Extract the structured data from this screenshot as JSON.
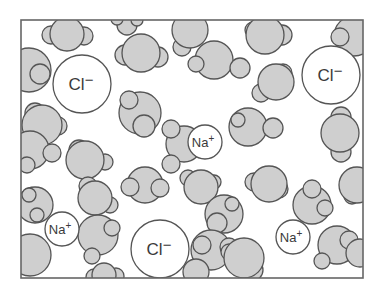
{
  "diagram": {
    "frame": {
      "x": 21,
      "y": 20,
      "w": 342,
      "h": 258
    },
    "colors": {
      "water_fill": "#cfcfcf",
      "stroke": "#555555",
      "ion_fill": "#ffffff",
      "background": "#ffffff"
    },
    "ions": [
      {
        "label": "Cl",
        "charge": "−",
        "cx": 82,
        "cy": 84,
        "r": 29
      },
      {
        "label": "Cl",
        "charge": "−",
        "cx": 331,
        "cy": 75,
        "r": 29
      },
      {
        "label": "Cl",
        "charge": "−",
        "cx": 160,
        "cy": 249,
        "r": 29
      },
      {
        "label": "Na",
        "charge": "+",
        "cx": 62,
        "cy": 229,
        "r": 17
      },
      {
        "label": "Na",
        "charge": "+",
        "cx": 205,
        "cy": 142,
        "r": 17
      },
      {
        "label": "Na",
        "charge": "+",
        "cx": 293,
        "cy": 237,
        "r": 17
      }
    ],
    "water_molecules": [
      {
        "o": [
          67,
          34,
          17
        ],
        "h": [
          [
            51,
            35,
            9
          ],
          [
            84,
            36,
            9
          ]
        ]
      },
      {
        "o": [
          127,
          25,
          10
        ],
        "h": [
          [
            117,
            19,
            6
          ],
          [
            137,
            20,
            6
          ]
        ]
      },
      {
        "o": [
          141,
          53,
          19
        ],
        "h": [
          [
            125,
            55,
            10
          ],
          [
            158,
            57,
            10
          ]
        ]
      },
      {
        "o": [
          29,
          70,
          22
        ],
        "h": [
          [
            40,
            74,
            10
          ]
        ]
      },
      {
        "o": [
          42,
          125,
          20
        ],
        "h": [
          [
            35,
            113,
            10
          ],
          [
            58,
            126,
            9
          ]
        ]
      },
      {
        "o": [
          140,
          113,
          21
        ],
        "h": [
          [
            129,
            100,
            9
          ],
          [
            144,
            126,
            11
          ]
        ]
      },
      {
        "o": [
          190,
          30,
          18
        ],
        "h": [
          [
            182,
            47,
            9
          ]
        ]
      },
      {
        "o": [
          214,
          60,
          19
        ],
        "h": [
          [
            196,
            64,
            8
          ],
          [
            240,
            68,
            10
          ]
        ]
      },
      {
        "o": [
          265,
          35,
          19
        ],
        "h": [
          [
            253,
            30,
            8
          ],
          [
            282,
            35,
            10
          ]
        ]
      },
      {
        "o": [
          354,
          36,
          20
        ],
        "h": [
          [
            340,
            37,
            9
          ]
        ]
      },
      {
        "o": [
          276,
          82,
          18
        ],
        "h": [
          [
            283,
            73,
            9
          ],
          [
            261,
            93,
            9
          ]
        ]
      },
      {
        "o": [
          184,
          144,
          18
        ],
        "h": [
          [
            171,
            129,
            9
          ],
          [
            171,
            164,
            9
          ]
        ]
      },
      {
        "o": [
          201,
          187,
          17
        ],
        "h": [
          [
            188,
            178,
            8
          ],
          [
            214,
            182,
            7
          ]
        ]
      },
      {
        "o": [
          248,
          127,
          19
        ],
        "h": [
          [
            273,
            128,
            10
          ],
          [
            238,
            120,
            7
          ]
        ]
      },
      {
        "o": [
          340,
          133,
          19
        ],
        "h": [
          [
            341,
            117,
            10
          ],
          [
            341,
            152,
            10
          ]
        ]
      },
      {
        "o": [
          30,
          150,
          19
        ],
        "h": [
          [
            52,
            153,
            9
          ],
          [
            27,
            165,
            8
          ]
        ]
      },
      {
        "o": [
          85,
          160,
          19
        ],
        "h": [
          [
            79,
            150,
            10
          ],
          [
            105,
            162,
            8
          ]
        ]
      },
      {
        "o": [
          35,
          205,
          18
        ],
        "h": [
          [
            29,
            195,
            7
          ],
          [
            37,
            215,
            7
          ]
        ]
      },
      {
        "o": [
          95,
          198,
          17
        ],
        "h": [
          [
            88,
            186,
            9
          ],
          [
            110,
            205,
            8
          ]
        ]
      },
      {
        "o": [
          145,
          185,
          18
        ],
        "h": [
          [
            130,
            187,
            9
          ],
          [
            160,
            188,
            9
          ]
        ]
      },
      {
        "o": [
          30,
          255,
          21
        ],
        "h": []
      },
      {
        "o": [
          98,
          235,
          20
        ],
        "h": [
          [
            112,
            228,
            8
          ],
          [
            92,
            256,
            8
          ]
        ]
      },
      {
        "o": [
          104,
          275,
          12
        ],
        "h": [
          [
            94,
            277,
            8
          ],
          [
            116,
            276,
            8
          ]
        ]
      },
      {
        "o": [
          224,
          214,
          19
        ],
        "h": [
          [
            217,
            223,
            10
          ],
          [
            232,
            204,
            7
          ]
        ]
      },
      {
        "o": [
          269,
          184,
          18
        ],
        "h": [
          [
            254,
            182,
            9
          ],
          [
            279,
            189,
            9
          ]
        ]
      },
      {
        "o": [
          312,
          205,
          19
        ],
        "h": [
          [
            312,
            189,
            9
          ],
          [
            325,
            208,
            8
          ]
        ]
      },
      {
        "o": [
          357,
          185,
          18
        ],
        "h": [
          [
            352,
            196,
            8
          ]
        ]
      },
      {
        "o": [
          211,
          250,
          20
        ],
        "h": [
          [
            202,
            245,
            9
          ],
          [
            229,
            247,
            9
          ]
        ]
      },
      {
        "o": [
          244,
          258,
          20
        ],
        "h": [
          [
            229,
            252,
            8
          ],
          [
            252,
            270,
            11
          ]
        ]
      },
      {
        "o": [
          337,
          245,
          19
        ],
        "h": [
          [
            349,
            240,
            9
          ],
          [
            322,
            261,
            8
          ]
        ]
      },
      {
        "o": [
          196,
          272,
          13
        ],
        "h": []
      },
      {
        "o": [
          360,
          253,
          14
        ],
        "h": []
      }
    ]
  }
}
